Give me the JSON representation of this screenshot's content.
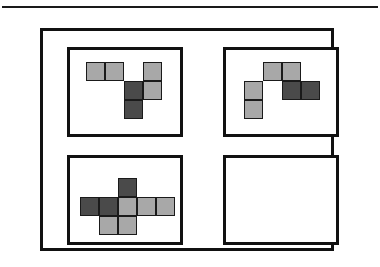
{
  "figure": {
    "top_rule": "horizontal-rule",
    "outer_frame": "outer-frame",
    "colors": {
      "light": "#a8a8a8",
      "dark": "#4a4a4a",
      "outline": "#1a1a1a",
      "frame": "#111111",
      "background": "#ffffff"
    },
    "cell_size": 19,
    "panels": [
      {
        "id": "panel-top-left",
        "position": "top-left",
        "empty": false,
        "origin": {
          "x": 16,
          "y": 12
        },
        "cells": [
          {
            "col": 0,
            "row": 0,
            "shade": "light"
          },
          {
            "col": 1,
            "row": 0,
            "shade": "light"
          },
          {
            "col": 3,
            "row": 0,
            "shade": "light"
          },
          {
            "col": 2,
            "row": 1,
            "shade": "dark"
          },
          {
            "col": 3,
            "row": 1,
            "shade": "light"
          },
          {
            "col": 2,
            "row": 2,
            "shade": "dark"
          }
        ]
      },
      {
        "id": "panel-top-right",
        "position": "top-right",
        "empty": false,
        "origin": {
          "x": 18,
          "y": 12
        },
        "cells": [
          {
            "col": 1,
            "row": 0,
            "shade": "light"
          },
          {
            "col": 2,
            "row": 0,
            "shade": "light"
          },
          {
            "col": 2,
            "row": 1,
            "shade": "dark"
          },
          {
            "col": 3,
            "row": 1,
            "shade": "dark"
          },
          {
            "col": 0,
            "row": 1,
            "shade": "light"
          },
          {
            "col": 0,
            "row": 2,
            "shade": "light"
          }
        ]
      },
      {
        "id": "panel-bottom-left",
        "position": "bottom-left",
        "empty": false,
        "origin": {
          "x": 10,
          "y": 20
        },
        "cells": [
          {
            "col": 2,
            "row": 0,
            "shade": "dark"
          },
          {
            "col": 0,
            "row": 1,
            "shade": "dark"
          },
          {
            "col": 1,
            "row": 1,
            "shade": "dark"
          },
          {
            "col": 2,
            "row": 1,
            "shade": "light"
          },
          {
            "col": 3,
            "row": 1,
            "shade": "light"
          },
          {
            "col": 4,
            "row": 1,
            "shade": "light"
          },
          {
            "col": 1,
            "row": 2,
            "shade": "light"
          },
          {
            "col": 2,
            "row": 2,
            "shade": "light"
          }
        ]
      },
      {
        "id": "panel-bottom-right",
        "position": "bottom-right",
        "empty": true,
        "origin": {
          "x": 0,
          "y": 0
        },
        "cells": []
      }
    ]
  }
}
